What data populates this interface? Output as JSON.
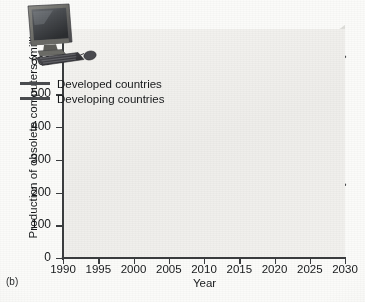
{
  "figure": {
    "panel_label": "(b)",
    "inset_image": "crt-computer-monitor-keyboard-mouse-photo",
    "plot_bg_color": "#f1f0ed",
    "line_color": "#4a4c4f",
    "band_light_color": "#dededa",
    "band_dark_color": "#bdbdb8"
  },
  "chart_data": {
    "type": "line",
    "title": "",
    "xlabel": "Year",
    "ylabel": "Production of obsolete computers (millions)",
    "xlim": [
      1990,
      2030
    ],
    "ylim": [
      0,
      700
    ],
    "xticks": [
      1990,
      1995,
      2000,
      2005,
      2010,
      2015,
      2020,
      2025,
      2030
    ],
    "yticks": [
      0,
      100,
      200,
      300,
      400,
      500,
      600,
      700
    ],
    "grid": false,
    "legend_position": "upper left",
    "x": [
      1990,
      1991,
      1992,
      1993,
      1994,
      1995,
      1996,
      1997,
      1998,
      1999,
      2000,
      2001,
      2002,
      2003,
      2004,
      2005,
      2006,
      2007,
      2008,
      2009,
      2010,
      2011,
      2012,
      2013,
      2014,
      2015,
      2016,
      2017,
      2018,
      2019,
      2020,
      2021,
      2022,
      2023,
      2024,
      2025,
      2026,
      2027,
      2028,
      2029,
      2030
    ],
    "series": [
      {
        "name": "Developed countries",
        "values": [
          3,
          6,
          10,
          14,
          19,
          26,
          34,
          44,
          56,
          62,
          66,
          72,
          78,
          76,
          74,
          80,
          92,
          104,
          112,
          116,
          124,
          134,
          148,
          162,
          176,
          188,
          196,
          200,
          203,
          206,
          210,
          214,
          217,
          219,
          220,
          221,
          221,
          222,
          222,
          223,
          224
        ],
        "band_low": [
          3,
          6,
          10,
          14,
          19,
          26,
          34,
          44,
          56,
          62,
          66,
          72,
          78,
          76,
          74,
          80,
          92,
          104,
          112,
          116,
          124,
          134,
          148,
          162,
          176,
          188,
          196,
          200,
          200,
          198,
          196,
          196,
          196,
          197,
          198,
          199,
          200,
          201,
          202,
          203,
          204
        ],
        "band_high": [
          3,
          6,
          10,
          14,
          19,
          26,
          34,
          44,
          56,
          62,
          66,
          72,
          78,
          76,
          74,
          80,
          92,
          104,
          112,
          116,
          124,
          134,
          148,
          162,
          176,
          188,
          196,
          200,
          208,
          216,
          240,
          246,
          252,
          256,
          260,
          264,
          267,
          270,
          272,
          274,
          276
        ]
      },
      {
        "name": "Developing countries",
        "values": [
          1,
          2,
          3,
          5,
          7,
          10,
          14,
          18,
          22,
          26,
          30,
          34,
          38,
          42,
          46,
          52,
          58,
          62,
          60,
          62,
          78,
          96,
          112,
          128,
          150,
          176,
          200,
          208,
          230,
          262,
          300,
          330,
          366,
          410,
          452,
          490,
          522,
          552,
          578,
          598,
          615
        ]
      }
    ],
    "band_developing": {
      "low": [
        1,
        2,
        3,
        5,
        7,
        10,
        14,
        18,
        22,
        26,
        30,
        34,
        38,
        42,
        46,
        52,
        58,
        62,
        60,
        62,
        78,
        96,
        112,
        128,
        150,
        176,
        200,
        206,
        222,
        244,
        270,
        290,
        312,
        338,
        364,
        386,
        406,
        424,
        438,
        450,
        460
      ],
      "high": [
        1,
        2,
        3,
        5,
        7,
        10,
        14,
        18,
        22,
        26,
        30,
        34,
        38,
        42,
        46,
        52,
        58,
        62,
        60,
        62,
        78,
        96,
        112,
        128,
        150,
        176,
        200,
        212,
        244,
        286,
        336,
        378,
        424,
        478,
        528,
        574,
        612,
        648,
        676,
        696,
        712
      ]
    },
    "annotations": [
      {
        "text": "Curves cross near 2017 at about 200 million"
      }
    ]
  }
}
